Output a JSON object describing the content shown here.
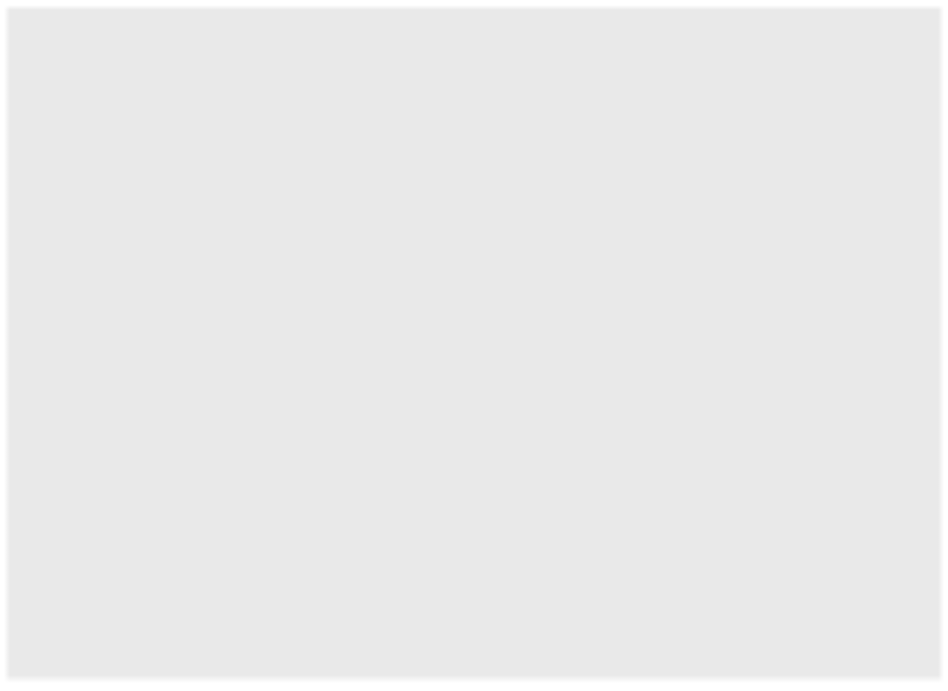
{
  "figure": {
    "background_color": "#e9e9e9",
    "plot_background_color": "#d8d8d8",
    "gridline_color": "#fafafa",
    "axis_color": "#3b3b3b",
    "series_color": "#4a4a4a",
    "shadow_color": "#b9b9b9"
  },
  "axis_titles": {
    "left": "Amount Needed to Purchase\nthe Same Basket of Goods",
    "right": "Purchasing Power of the Current\nDollar in Terms of the 1941 Dollar",
    "bottom": "Year"
  },
  "annotation": {
    "text": "When the U.S. went\noff the gold standard"
  },
  "chart_data": {
    "type": "line",
    "title": "",
    "subtitle": "",
    "xlabel": "Year",
    "ylabel": "Amount Needed to Purchase the Same Basket of Goods",
    "y2label": "Purchasing Power of the Current Dollar in Terms of the 1941 Dollar",
    "grid": true,
    "legend": "none",
    "xlim": [
      1800,
      2010
    ],
    "xticks": [
      1800,
      1820,
      1840,
      1860,
      1880,
      1900,
      1920,
      1940,
      1960,
      1980,
      2000,
      2010
    ],
    "xticklabels": [
      "1800",
      "1820",
      "1840",
      "1860",
      "1880",
      "1900",
      "1920",
      "1940",
      "1960",
      "1980",
      "2000",
      "2010"
    ],
    "yticks_left": [
      1,
      2,
      3,
      4,
      5,
      6,
      7,
      8,
      9,
      10,
      11,
      12,
      13,
      14
    ],
    "yticklabels_left": [
      "$1",
      "$2",
      "$3",
      "$4",
      "$5",
      "$6",
      "$7",
      "$8",
      "$9",
      "$10",
      "$11",
      "$12",
      "$13",
      "$14"
    ],
    "yticks_right": [
      1,
      2,
      3,
      4,
      5,
      6,
      7,
      8,
      9,
      10,
      11,
      12,
      13,
      14
    ],
    "yticklabels_right": [
      "$1.00",
      ".50",
      ".35",
      ".25",
      ".20",
      ".17",
      ".14",
      ".13",
      ".11",
      ".10",
      ".09",
      ".08",
      ".07",
      ".06"
    ],
    "ylim_left": [
      0.6,
      14
    ],
    "y_inverted": true,
    "annotations": [
      {
        "text": "When the U.S. went\noff the gold standard",
        "points_to_year": 1936,
        "points_to_value": 0.95
      }
    ],
    "series": [
      {
        "name": "Amount needed to purchase the same basket of goods (dollars)",
        "x": [
          1800,
          1803,
          1806,
          1809,
          1812,
          1814,
          1816,
          1819,
          1821,
          1824,
          1827,
          1830,
          1833,
          1836,
          1839,
          1842,
          1845,
          1848,
          1851,
          1854,
          1857,
          1860,
          1863,
          1865,
          1867,
          1870,
          1873,
          1876,
          1879,
          1882,
          1885,
          1888,
          1891,
          1894,
          1897,
          1900,
          1903,
          1906,
          1909,
          1912,
          1915,
          1918,
          1920,
          1922,
          1925,
          1929,
          1932,
          1934,
          1937,
          1940,
          1941,
          1944,
          1947,
          1950,
          1953,
          1956,
          1960,
          1964,
          1968,
          1972,
          1975,
          1978,
          1981,
          1984,
          1987,
          1990,
          1995,
          2000,
          2005,
          2010
        ],
        "values": [
          1.05,
          1.0,
          1.12,
          1.02,
          1.18,
          1.3,
          1.12,
          1.08,
          0.92,
          0.8,
          0.86,
          0.8,
          0.82,
          0.95,
          1.0,
          0.82,
          0.82,
          0.84,
          0.82,
          0.88,
          0.9,
          0.86,
          1.12,
          1.26,
          1.14,
          1.02,
          1.0,
          0.88,
          0.8,
          0.86,
          0.82,
          0.82,
          0.82,
          0.78,
          0.76,
          0.8,
          0.82,
          0.86,
          0.9,
          0.94,
          0.96,
          1.42,
          1.72,
          1.32,
          1.3,
          1.26,
          1.02,
          1.06,
          1.1,
          1.02,
          1.0,
          1.18,
          1.52,
          1.62,
          1.72,
          1.74,
          1.9,
          1.98,
          2.22,
          2.6,
          3.4,
          4.3,
          6.3,
          7.7,
          8.3,
          9.1,
          10.6,
          11.9,
          13.1,
          14.0
        ]
      }
    ]
  }
}
